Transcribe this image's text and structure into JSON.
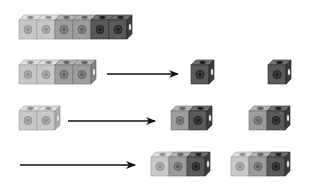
{
  "colors": {
    "light": "#c8c8c8",
    "mid": "#9d9d9d",
    "dark": "#5a5a5a",
    "arrow": "#111111",
    "background": "#ffffff"
  },
  "cube": {
    "face_w": 18,
    "face_h": 19,
    "depth": 5
  },
  "rows": [
    {
      "name": "row-1-full-train",
      "groups": [
        {
          "x": 19,
          "y": 20,
          "cubes": [
            "light",
            "light",
            "mid",
            "mid",
            "dark",
            "dark"
          ]
        }
      ],
      "arrow": null
    },
    {
      "name": "row-2",
      "groups": [
        {
          "x": 19,
          "y": 65,
          "cubes": [
            "light",
            "light",
            "mid",
            "mid"
          ]
        },
        {
          "x": 191,
          "y": 65,
          "cubes": [
            "dark"
          ]
        },
        {
          "x": 268,
          "y": 65,
          "cubes": [
            "dark"
          ]
        }
      ],
      "arrow": {
        "x1": 107,
        "x2": 178,
        "y": 74
      }
    },
    {
      "name": "row-3",
      "groups": [
        {
          "x": 19,
          "y": 111,
          "cubes": [
            "light",
            "light"
          ]
        },
        {
          "x": 171,
          "y": 111,
          "cubes": [
            "mid",
            "dark"
          ]
        },
        {
          "x": 249,
          "y": 111,
          "cubes": [
            "mid",
            "dark"
          ]
        }
      ],
      "arrow": {
        "x1": 68,
        "x2": 155,
        "y": 121
      }
    },
    {
      "name": "row-4",
      "groups": [
        {
          "x": 151,
          "y": 157,
          "cubes": [
            "light",
            "mid",
            "dark"
          ]
        },
        {
          "x": 231,
          "y": 157,
          "cubes": [
            "light",
            "mid",
            "dark"
          ]
        }
      ],
      "arrow": {
        "x1": 20,
        "x2": 135,
        "y": 165
      }
    }
  ]
}
